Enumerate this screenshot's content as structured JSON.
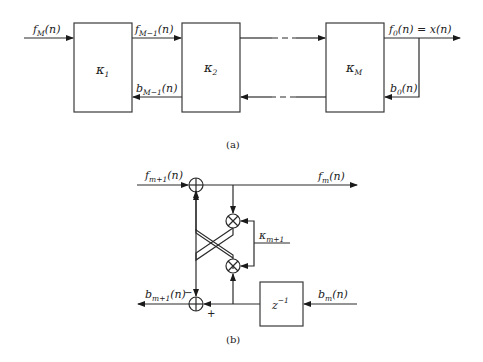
{
  "diagram_a": {
    "caption": "(a)",
    "input_label": {
      "base": "f",
      "sub": "M",
      "arg": "(n)"
    },
    "blocks": [
      {
        "symbol": "κ",
        "sub": "1"
      },
      {
        "symbol": "κ",
        "sub": "2"
      },
      {
        "symbol": "κ",
        "sub": "M"
      }
    ],
    "forward_label_1": {
      "base": "f",
      "sub": "M−1",
      "arg": "(n)"
    },
    "backward_label_1": {
      "base": "b",
      "sub": "M−1",
      "arg": "(n)"
    },
    "output_label": {
      "base": "f",
      "sub": "0",
      "arg": "(n) = x(n)"
    },
    "feedback_label": {
      "base": "b",
      "sub": "0",
      "arg": "(n)"
    }
  },
  "diagram_b": {
    "caption": "(b)",
    "input_forward": {
      "base": "f",
      "sub": "m+1",
      "arg": "(n)"
    },
    "output_forward": {
      "base": "f",
      "sub": "m",
      "arg": "(n)"
    },
    "output_backward": {
      "base": "b",
      "sub": "m+1",
      "arg": "(n)"
    },
    "input_backward": {
      "base": "b",
      "sub": "m",
      "arg": "(n)"
    },
    "coefficient": {
      "symbol": "κ",
      "sub": "m+1"
    },
    "delay": {
      "base": "z",
      "sup": "−1"
    },
    "minus_sign": "−",
    "plus_sign": "+"
  }
}
